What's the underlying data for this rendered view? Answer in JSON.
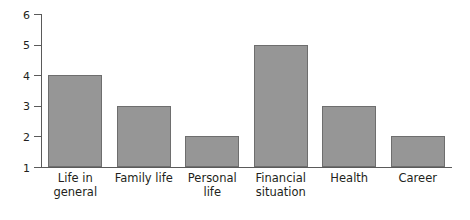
{
  "chart_data": {
    "type": "bar",
    "title": "",
    "subtitle": "",
    "xlabel": "",
    "ylabel": "",
    "categories": [
      "Life in general",
      "Family life",
      "Personal life",
      "Financial situation",
      "Health",
      "Career"
    ],
    "category_lines": [
      [
        "Life in",
        "general"
      ],
      [
        "Family life"
      ],
      [
        "Personal",
        "life"
      ],
      [
        "Financial",
        "situation"
      ],
      [
        "Health"
      ],
      [
        "Career"
      ]
    ],
    "values": [
      4,
      3,
      2,
      5,
      3,
      2
    ],
    "ylim": [
      1,
      6
    ],
    "yticks": [
      1,
      2,
      3,
      4,
      5,
      6
    ],
    "ytick_labels": [
      "1",
      "2",
      "3",
      "4",
      "5",
      "6"
    ],
    "xticks": [],
    "grid": false,
    "legend": false,
    "legend_position": "none",
    "bar_color": "#969696",
    "bar_edge_color": "#6e6e6e",
    "axis_color": "#5a5a5a",
    "background_color": "#ffffff",
    "text_color": "#231f20"
  }
}
